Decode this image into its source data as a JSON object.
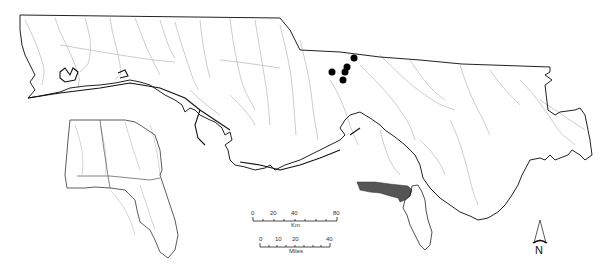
{
  "map": {
    "colors": {
      "background": "#ffffff",
      "boundary": "#222222",
      "rivers": "#b0b0b0",
      "sites": "#000000",
      "highlight_region": "#555555"
    },
    "sites": [
      {
        "x": 354,
        "y": 57
      },
      {
        "x": 332,
        "y": 71
      },
      {
        "x": 347,
        "y": 67
      },
      {
        "x": 345,
        "y": 72
      },
      {
        "x": 343,
        "y": 80
      }
    ]
  },
  "scale_bar_km": {
    "ticks": [
      "0",
      "20",
      "40",
      "80"
    ],
    "unit": "Km"
  },
  "scale_bar_miles": {
    "ticks": [
      "0",
      "10",
      "20",
      "40"
    ],
    "unit": "Miles"
  },
  "north_arrow": {
    "label": "N"
  }
}
